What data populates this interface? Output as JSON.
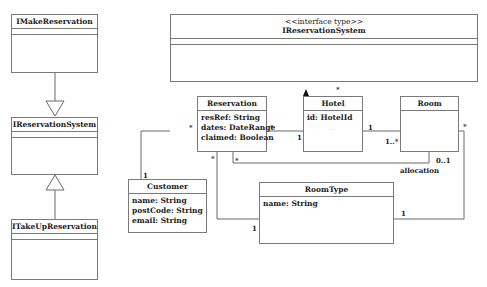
{
  "interfaces": {
    "imake": {
      "name": "IMakeReservation"
    },
    "ireservation_small": {
      "name": "IReservationSystem"
    },
    "itakeup": {
      "name": "ITakeUpReservation"
    }
  },
  "system": {
    "stereotype": "<<interface type>>",
    "name": "IReservationSystem"
  },
  "classes": {
    "reservation": {
      "name": "Reservation",
      "attrs": [
        "resRef: String",
        "dates: DateRange",
        "claimed: Boolean"
      ]
    },
    "hotel": {
      "name": "Hotel",
      "attrs": [
        "id: HotelId",
        "."
      ]
    },
    "room": {
      "name": "Room",
      "attrs": []
    },
    "customer": {
      "name": "Customer",
      "attrs": [
        "name: String",
        "postCode: String",
        "email: String"
      ]
    },
    "roomtype": {
      "name": "RoomType",
      "attrs": [
        "name: String"
      ]
    }
  },
  "multiplicities": {
    "hotel_composition": "*",
    "reservation_customer_res": "*",
    "reservation_customer_cust": "1",
    "reservation_hotel_res": "*",
    "reservation_hotel_hotel": "1",
    "hotel_room_hotel": "1",
    "hotel_room_room": "1..*",
    "reservation_roomtype_res": "*",
    "reservation_roomtype_type": "1",
    "reservation_room_res": "*",
    "reservation_room_room": "0..1",
    "room_roomtype_room": "*",
    "room_roomtype_type": "1"
  },
  "association_names": {
    "allocation": "allocation"
  }
}
